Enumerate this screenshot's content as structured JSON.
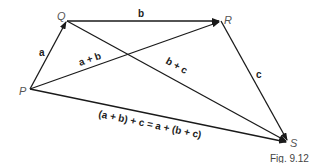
{
  "points": {
    "P": "P",
    "Q": "Q",
    "R": "R",
    "S": "S"
  },
  "vectors": {
    "a": "a",
    "b": "b",
    "c": "c",
    "a_plus_b": "a + b",
    "b_plus_c": "b + c",
    "associative": "(a + b) + c = a + (b + c)"
  },
  "caption": "Fig. 9.12"
}
